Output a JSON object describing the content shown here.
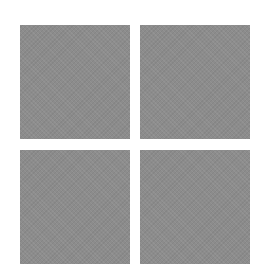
{
  "logo": {
    "name": "four-square-logo",
    "tiles": [
      {
        "position": "top-left",
        "color": "#8c8c8c"
      },
      {
        "position": "top-right",
        "color": "#8c8c8c"
      },
      {
        "position": "bottom-left",
        "color": "#8c8c8c"
      },
      {
        "position": "bottom-right",
        "color": "#8c8c8c"
      }
    ],
    "background": "#ffffff"
  }
}
